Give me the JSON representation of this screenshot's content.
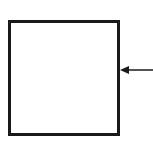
{
  "diagram": {
    "shapes": [
      {
        "type": "square",
        "stroke": "#1a1a1a",
        "fill": "#ffffff"
      }
    ],
    "arrows": [
      {
        "direction": "left",
        "target": "square-right-edge",
        "color": "#1a1a1a"
      }
    ]
  }
}
